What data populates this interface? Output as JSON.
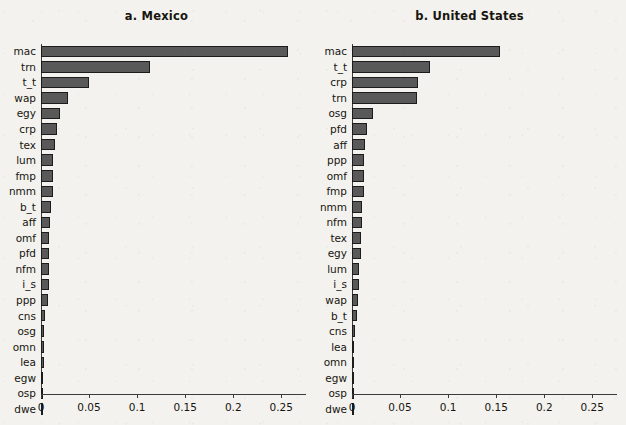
{
  "figure": {
    "background_color": "#f3f2ee",
    "bar_fill_color": "#595959",
    "bar_edge_color": "#1c1c1c",
    "axis_color": "#3a3a3a"
  },
  "panels": [
    {
      "id": "panel-a",
      "title": "a. Mexico",
      "axis": {
        "ticks": [
          "0",
          "0.05",
          "0.1",
          "0.15",
          "0.2",
          "0.25"
        ],
        "tick_values": [
          0,
          0.05,
          0.1,
          0.15,
          0.2,
          0.25
        ],
        "xlim": [
          0,
          0.2757
        ]
      }
    },
    {
      "id": "panel-b",
      "title": "b. United States",
      "axis": {
        "ticks": [
          "0",
          "0.05",
          "0.1",
          "0.15",
          "0.2",
          "0.25"
        ],
        "tick_values": [
          0,
          0.05,
          0.1,
          0.15,
          0.2,
          0.25
        ],
        "xlim": [
          0,
          0.2757
        ]
      }
    }
  ],
  "chart_data": [
    {
      "type": "bar",
      "orientation": "horizontal",
      "title": "a. Mexico",
      "xlabel": "",
      "ylabel": "",
      "xlim": [
        0,
        0.2757
      ],
      "xticks": [
        0,
        0.05,
        0.1,
        0.15,
        0.2,
        0.25
      ],
      "grid": false,
      "legend": false,
      "categories": [
        "mac",
        "trn",
        "t_t",
        "wap",
        "egy",
        "crp",
        "tex",
        "lum",
        "fmp",
        "nmm",
        "b_t",
        "aff",
        "omf",
        "pfd",
        "nfm",
        "i_s",
        "ppp",
        "cns",
        "osg",
        "omn",
        "lea",
        "egw",
        "osp",
        "dwe"
      ],
      "values": [
        0.257,
        0.113,
        0.05,
        0.028,
        0.02,
        0.017,
        0.0145,
        0.0125,
        0.0122,
        0.012,
        0.01,
        0.009,
        0.0088,
        0.0085,
        0.0082,
        0.008,
        0.007,
        0.0038,
        0.0035,
        0.0032,
        0.003,
        0.0008,
        0.0004,
        0.0002
      ]
    },
    {
      "type": "bar",
      "orientation": "horizontal",
      "title": "b. United States",
      "xlabel": "",
      "ylabel": "",
      "xlim": [
        0,
        0.2757
      ],
      "xticks": [
        0,
        0.05,
        0.1,
        0.15,
        0.2,
        0.25
      ],
      "grid": false,
      "legend": false,
      "categories": [
        "mac",
        "t_t",
        "crp",
        "trn",
        "osg",
        "pfd",
        "aff",
        "ppp",
        "omf",
        "fmp",
        "nmm",
        "nfm",
        "tex",
        "egy",
        "lum",
        "i_s",
        "wap",
        "b_t",
        "cns",
        "lea",
        "omn",
        "egw",
        "osp",
        "dwe"
      ],
      "values": [
        0.154,
        0.081,
        0.069,
        0.068,
        0.022,
        0.016,
        0.0135,
        0.013,
        0.0128,
        0.012,
        0.0105,
        0.01,
        0.0095,
        0.009,
        0.0075,
        0.007,
        0.006,
        0.0055,
        0.0035,
        0.0022,
        0.002,
        0.0015,
        0.0004,
        0.0002
      ]
    }
  ]
}
